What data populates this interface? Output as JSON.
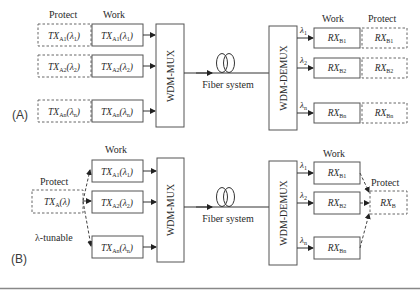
{
  "panels": {
    "A": {
      "label": "(A)",
      "tx_protect_header": "Protect",
      "tx_work_header": "Work",
      "tx_protect": [
        {
          "main": "TX",
          "sub": "A1",
          "lam": "(λ",
          "lsub": "1",
          "close": ")"
        },
        {
          "main": "TX",
          "sub": "A2",
          "lam": "(λ",
          "lsub": "2",
          "close": ")"
        },
        {
          "main": "TX",
          "sub": "An",
          "lam": "(λ",
          "lsub": "n",
          "close": ")"
        }
      ],
      "tx_work": [
        {
          "main": "TX",
          "sub": "A1",
          "lam": "(λ",
          "lsub": "1",
          "close": ")"
        },
        {
          "main": "TX",
          "sub": "A2",
          "lam": "(λ",
          "lsub": "2",
          "close": ")"
        },
        {
          "main": "TX",
          "sub": "An",
          "lam": "(λ",
          "lsub": "n",
          "close": ")"
        }
      ],
      "mux": "WDM-MUX",
      "fiber": "Fiber system",
      "demux": "WDM-DEMUX",
      "lambdas": [
        {
          "l": "λ",
          "s": "1"
        },
        {
          "l": "λ",
          "s": "2"
        },
        {
          "l": "λ",
          "s": "n"
        }
      ],
      "rx_work_header": "Work",
      "rx_protect_header": "Protect",
      "rx_work": [
        {
          "main": "RX",
          "sub": "B1"
        },
        {
          "main": "RX",
          "sub": "B2"
        },
        {
          "main": "RX",
          "sub": "Bn"
        }
      ],
      "rx_protect": [
        {
          "main": "RX",
          "sub": "B1"
        },
        {
          "main": "RX",
          "sub": "B2"
        },
        {
          "main": "RX",
          "sub": "Bn"
        }
      ]
    },
    "B": {
      "label": "(B)",
      "tx_protect_header": "Protect",
      "tx_protect": {
        "main": "TX",
        "sub": "A",
        "lam": "(λ)"
      },
      "tunable": "λ-tunable",
      "tx_work_header": "Work",
      "tx_work": [
        {
          "main": "TX",
          "sub": "A1",
          "lam": "(λ",
          "lsub": "1",
          "close": ")"
        },
        {
          "main": "TX",
          "sub": "A2",
          "lam": "(λ",
          "lsub": "2",
          "close": ")"
        },
        {
          "main": "TX",
          "sub": "An",
          "lam": "(λ",
          "lsub": "n",
          "close": ")"
        }
      ],
      "mux": "WDM-MUX",
      "fiber": "Fiber system",
      "demux": "WDM-DEMUX",
      "lambdas": [
        {
          "l": "λ",
          "s": "1"
        },
        {
          "l": "λ",
          "s": "2"
        },
        {
          "l": "λ",
          "s": "n"
        }
      ],
      "rx_work_header": "Work",
      "rx_work": [
        {
          "main": "RX",
          "sub": "B1"
        },
        {
          "main": "RX",
          "sub": "B2"
        },
        {
          "main": "RX",
          "sub": "Bn"
        }
      ],
      "rx_protect_header": "Protect",
      "rx_protect": {
        "main": "RX",
        "sub": "B"
      }
    }
  }
}
